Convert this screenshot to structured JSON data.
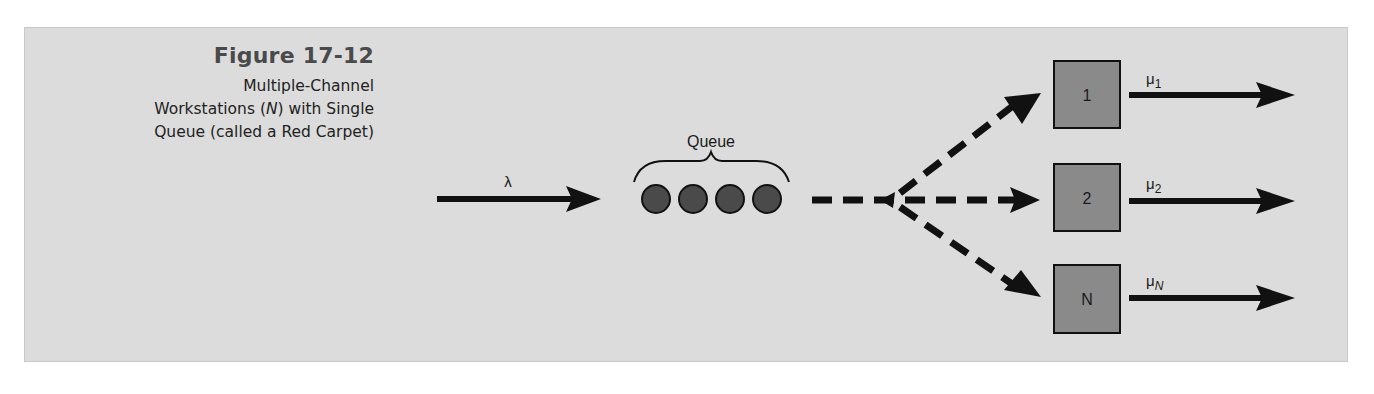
{
  "figure": {
    "number": "Figure 17-12",
    "caption_lines": [
      "Multiple-Channel",
      "Workstations (N) with Single",
      "Queue (called a Red Carpet)"
    ],
    "caption_line2_prefix": "Workstations (",
    "caption_line2_italic": "N",
    "caption_line2_suffix": ") with Single"
  },
  "diagram": {
    "arrival_label": "λ",
    "queue_label": "Queue",
    "queue_items": 4,
    "stations": [
      {
        "label": "1",
        "rate_symbol": "μ",
        "rate_sub": "1"
      },
      {
        "label": "2",
        "rate_symbol": "μ",
        "rate_sub": "2"
      },
      {
        "label": "N",
        "rate_symbol": "μ",
        "rate_sub": "N"
      }
    ],
    "colors": {
      "background": "#dcdcdc",
      "station_fill": "#8a8a8a",
      "queue_item_fill": "#4a4a4a",
      "arrow": "#111111",
      "title": "#4a4a4a"
    }
  }
}
